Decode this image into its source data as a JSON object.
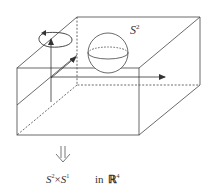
{
  "diagram": {
    "sphere_label": {
      "base": "S",
      "sup": "2"
    },
    "caption": {
      "left_base": "S",
      "left_sup": "2",
      "times": "×",
      "right_base": "S",
      "right_sup": "1",
      "in_text": "in",
      "space": "ℝ",
      "space_sup": "4"
    },
    "implies_symbol": "⇓",
    "colors": {
      "stroke": "#333333",
      "background": "#ffffff"
    }
  }
}
